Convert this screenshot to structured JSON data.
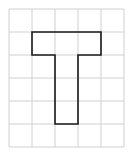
{
  "diagram": {
    "type": "grid-figure",
    "grid": {
      "columns": 5,
      "rows": 6,
      "cell_size": 23,
      "origin_x": 9,
      "origin_y": 9,
      "line_color": "#d0d0d0"
    },
    "shape": {
      "name": "T-shape",
      "stroke_color": "#1a1a1a",
      "vertices_cells": [
        [
          1,
          1
        ],
        [
          4,
          1
        ],
        [
          4,
          2
        ],
        [
          3,
          2
        ],
        [
          3,
          5
        ],
        [
          2,
          5
        ],
        [
          2,
          2
        ],
        [
          1,
          2
        ]
      ]
    }
  }
}
